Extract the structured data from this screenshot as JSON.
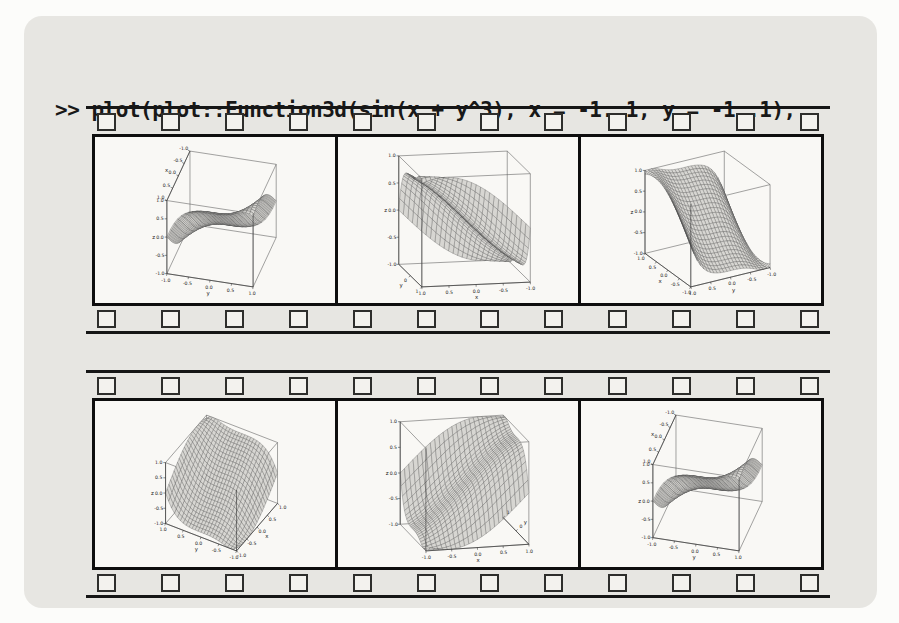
{
  "command": {
    "prompt": ">>",
    "line1": "plot(plot::Function3d(sin(x + y^3), x = -1..1, y = -1..1),",
    "line2": "Kamera):"
  },
  "film": {
    "strip_count": 2,
    "frames_per_strip": 3,
    "sprockets_per_row": 12
  },
  "colors": {
    "panel_bg": "#e7e6e2",
    "frame_bg": "#f9f8f5",
    "film_ink": "#161616",
    "surface_fill": "#d7d6d2",
    "surface_line": "#4a4a4a",
    "box_line": "#5a5a5a"
  },
  "chart_data": {
    "type": "surface",
    "function": "sin(x + y^3)",
    "x_range": [
      -1,
      1
    ],
    "y_range": [
      -1,
      1
    ],
    "z_range": [
      -1,
      1
    ],
    "note": "six frames of a camera animation (Kamera) around the same surface",
    "views": [
      {
        "camera": {
          "azimuth_deg": 15,
          "elevation_deg": 35
        },
        "axes": {
          "x": {
            "label": "x",
            "edge": {
              "y": -1,
              "z": 1
            },
            "ticks": [
              1,
              0.5,
              0,
              -0.5,
              -1
            ],
            "tick_labels": [
              "1.0",
              "0.5",
              "0.0",
              "-0.5",
              "-1.0"
            ]
          },
          "y": {
            "label": "y",
            "edge": {
              "x": 1,
              "z": -1
            },
            "ticks": [
              -1,
              -0.5,
              0,
              0.5,
              1
            ],
            "tick_labels": [
              "-1.0",
              "-0.5",
              "0.0",
              "0.5",
              "1.0"
            ]
          },
          "z": {
            "label": "z",
            "edge": {
              "x": 1,
              "y": -1
            },
            "ticks": [
              1,
              0.5,
              0,
              -0.5,
              -1
            ],
            "tick_labels": [
              "1.0",
              "0.5",
              "0.0",
              "-0.5",
              "-1.0"
            ]
          }
        }
      },
      {
        "camera": {
          "azimuth_deg": 78,
          "elevation_deg": 12
        },
        "axes": {
          "x": {
            "label": "x",
            "edge": {
              "y": 1,
              "z": -1
            },
            "ticks": [
              1,
              0.5,
              0,
              -0.5,
              -1
            ],
            "tick_labels": [
              "1.0",
              "0.5",
              "0.0",
              "-0.5",
              "-1.0"
            ]
          },
          "y": {
            "label": "y",
            "edge": {
              "x": 1,
              "z": -1
            },
            "ticks": [
              0,
              1
            ],
            "tick_labels": [
              "0",
              "1"
            ]
          },
          "z": {
            "label": "z",
            "edge": {
              "x": 1,
              "y": -1
            },
            "ticks": [
              1,
              0.5,
              0,
              -0.5,
              -1
            ],
            "tick_labels": [
              "1.0",
              "0.5",
              "0.0",
              "-0.5",
              "-1.0"
            ]
          }
        }
      },
      {
        "camera": {
          "azimuth_deg": 150,
          "elevation_deg": 25
        },
        "axes": {
          "x": {
            "label": "x",
            "edge": {
              "y": 1,
              "z": -1
            },
            "ticks": [
              1,
              0.5,
              0,
              -0.5,
              -1
            ],
            "tick_labels": [
              "1.0",
              "0.5",
              "0.0",
              "-0.5",
              "-1.0"
            ]
          },
          "y": {
            "label": "y",
            "edge": {
              "x": -1,
              "z": -1
            },
            "ticks": [
              1,
              0.5,
              0,
              -0.5,
              -1
            ],
            "tick_labels": [
              "1.0",
              "0.5",
              "0.0",
              "-0.5",
              "-1.0"
            ]
          },
          "z": {
            "label": "z",
            "edge": {
              "x": 1,
              "y": 1
            },
            "ticks": [
              1,
              0.5,
              0,
              -0.5,
              -1
            ],
            "tick_labels": [
              "1.0",
              "0.5",
              "0.0",
              "-0.5",
              "-1.0"
            ]
          }
        }
      },
      {
        "camera": {
          "azimuth_deg": 210,
          "elevation_deg": 42
        },
        "axes": {
          "x": {
            "label": "x",
            "edge": {
              "y": -1,
              "z": -1
            },
            "ticks": [
              1,
              0.5,
              0,
              -0.5,
              -1
            ],
            "tick_labels": [
              "1.0",
              "0.5",
              "0.0",
              "-0.5",
              "-1.0"
            ]
          },
          "y": {
            "label": "y",
            "edge": {
              "x": -1,
              "z": -1
            },
            "ticks": [
              1,
              0.5,
              0,
              -0.5,
              -1
            ],
            "tick_labels": [
              "1.0",
              "0.5",
              "0.0",
              "-0.5",
              "-1.0"
            ]
          },
          "z": {
            "label": "z",
            "edge": {
              "x": -1,
              "y": 1
            },
            "ticks": [
              1,
              0.5,
              0,
              -0.5,
              -1
            ],
            "tick_labels": [
              "1.0",
              "0.5",
              "0.0",
              "-0.5",
              "-1.0"
            ]
          }
        }
      },
      {
        "camera": {
          "azimuth_deg": 256,
          "elevation_deg": 15
        },
        "axes": {
          "x": {
            "label": "x",
            "edge": {
              "y": -1,
              "z": -1
            },
            "ticks": [
              -1,
              -0.5,
              0,
              0.5,
              1
            ],
            "tick_labels": [
              "-1.0",
              "-0.5",
              "0.0",
              "0.5",
              "1.0"
            ]
          },
          "y": {
            "label": "y",
            "edge": {
              "x": 1,
              "z": -1
            },
            "ticks": [
              1,
              0
            ],
            "tick_labels": [
              "1",
              "0"
            ]
          },
          "z": {
            "label": "z",
            "edge": {
              "x": -1,
              "y": 1
            },
            "ticks": [
              1,
              0.5,
              0,
              -0.5,
              -1
            ],
            "tick_labels": [
              "1.0",
              "0.5",
              "0.0",
              "-0.5",
              "-1.0"
            ]
          }
        }
      },
      {
        "camera": {
          "azimuth_deg": 15,
          "elevation_deg": 35
        },
        "axes": {
          "x": {
            "label": "x",
            "edge": {
              "y": -1,
              "z": 1
            },
            "ticks": [
              1,
              0.5,
              0,
              -0.5,
              -1
            ],
            "tick_labels": [
              "1.0",
              "0.5",
              "0.0",
              "-0.5",
              "-1.0"
            ]
          },
          "y": {
            "label": "y",
            "edge": {
              "x": 1,
              "z": -1
            },
            "ticks": [
              -1,
              -0.5,
              0,
              0.5,
              1
            ],
            "tick_labels": [
              "-1.0",
              "-0.5",
              "0.0",
              "0.5",
              "1.0"
            ]
          },
          "z": {
            "label": "z",
            "edge": {
              "x": 1,
              "y": -1
            },
            "ticks": [
              1,
              0.5,
              0,
              -0.5,
              -1
            ],
            "tick_labels": [
              "1.0",
              "0.5",
              "0.0",
              "-0.5",
              "-1.0"
            ]
          }
        }
      }
    ]
  }
}
